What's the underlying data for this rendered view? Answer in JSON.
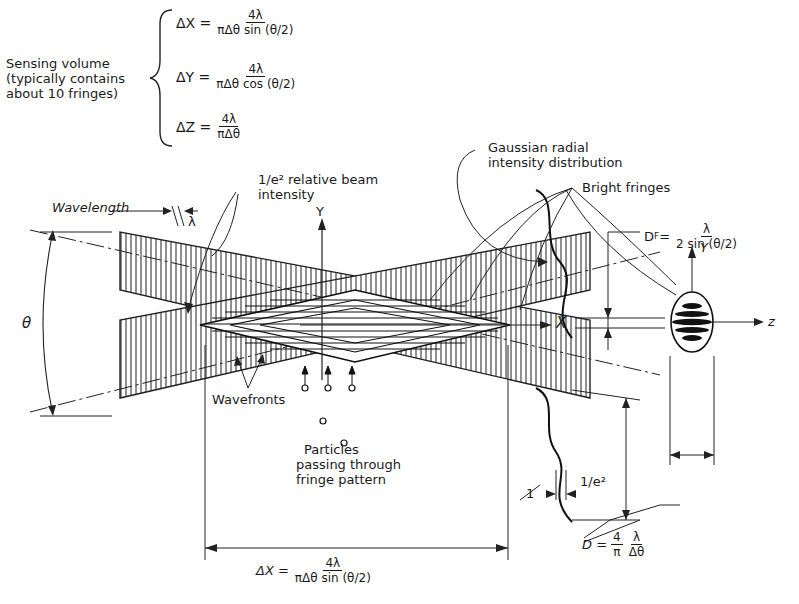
{
  "sensing_volume": {
    "label_lines": [
      "Sensing volume",
      "(typically contains",
      "about 10 fringes)"
    ],
    "equations": [
      {
        "lhs": "ΔX =",
        "num": "4λ",
        "den": "πΔθ sin (θ/2)"
      },
      {
        "lhs": "ΔY =",
        "num": "4λ",
        "den": "πΔθ cos (θ/2)"
      },
      {
        "lhs": "ΔZ =",
        "num": "4λ",
        "den": "πΔθ"
      }
    ]
  },
  "labels": {
    "gaussian": [
      "Gaussian radial",
      "intensity distribution"
    ],
    "beam_intensity": [
      "1/e² relative beam",
      "intensity"
    ],
    "bright_fringes": "Bright fringes",
    "wavelength": "Wavelength",
    "lambda": "λ",
    "theta": "θ",
    "axis_y": "Y",
    "axis_x": "X",
    "axis_z": "z",
    "axis_y_small": "Y",
    "wavefronts": "Wavefronts",
    "particles": [
      "Particles",
      "passing through",
      "fringe pattern"
    ],
    "one": "1",
    "one_over_e2": "1/e²",
    "fringe_spacing": {
      "lhs": "D",
      "sub": "F",
      "eq": " =",
      "num": "λ",
      "den": "2 sin (θ/2)"
    },
    "beam_diameter": {
      "lhs": "D =",
      "a_num": "4",
      "a_den": "π",
      "b_num": "λ",
      "b_den": "Δθ"
    },
    "bottom_dx": {
      "lhs": "ΔX =",
      "num": "4λ",
      "den": "πΔθ sin (θ/2)"
    }
  }
}
